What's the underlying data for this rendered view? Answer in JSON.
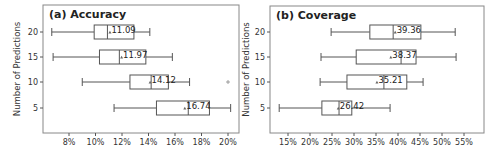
{
  "chart_data": [
    {
      "type": "box",
      "title": "(a) Accuracy",
      "xlabel": "",
      "ylabel": "Number of Predictions",
      "orientation": "horizontal",
      "xlim": [
        6.3,
        20.7
      ],
      "xticks": [
        8,
        10,
        12,
        14,
        16,
        18,
        20
      ],
      "xtick_labels": [
        "8%",
        "10%",
        "12%",
        "14%",
        "16%",
        "18%",
        "20%"
      ],
      "categories": [
        "20",
        "15",
        "10",
        "5"
      ],
      "series": [
        {
          "name": "20",
          "whisker_low": 6.7,
          "q1": 9.9,
          "median": 10.9,
          "q3": 12.9,
          "whisker_high": 14.1,
          "mean": 11.09,
          "outliers": []
        },
        {
          "name": "15",
          "whisker_low": 6.8,
          "q1": 10.3,
          "median": 11.8,
          "q3": 13.8,
          "whisker_high": 15.8,
          "mean": 11.97,
          "outliers": []
        },
        {
          "name": "10",
          "whisker_low": 9.0,
          "q1": 12.6,
          "median": 14.2,
          "q3": 15.5,
          "whisker_high": 17.1,
          "mean": 14.12,
          "outliers": [
            20.0
          ]
        },
        {
          "name": "5",
          "whisker_low": 11.4,
          "q1": 14.6,
          "median": 17.0,
          "q3": 18.6,
          "whisker_high": 20.2,
          "mean": 16.74,
          "outliers": []
        }
      ],
      "mean_labels": [
        "11.09",
        "11.97",
        "14.12",
        "16.74"
      ],
      "grid": false,
      "legend": null
    },
    {
      "type": "box",
      "title": "(b) Coverage",
      "xlabel": "",
      "ylabel": "Number of Predictions",
      "orientation": "horizontal",
      "xlim": [
        10.9,
        55.5
      ],
      "xticks": [
        15,
        20,
        25,
        30,
        35,
        40,
        45,
        50,
        55
      ],
      "xtick_labels": [
        "15%",
        "20%",
        "25%",
        "30%",
        "35%",
        "40%",
        "45%",
        "50%",
        "55%"
      ],
      "categories": [
        "20",
        "15",
        "10",
        "5"
      ],
      "series": [
        {
          "name": "20",
          "whisker_low": 24.8,
          "q1": 33.6,
          "median": 38.9,
          "q3": 45.2,
          "whisker_high": 53.0,
          "mean": 39.36,
          "outliers": []
        },
        {
          "name": "15",
          "whisker_low": 22.5,
          "q1": 30.5,
          "median": 40.7,
          "q3": 44.1,
          "whisker_high": 53.2,
          "mean": 38.37,
          "outliers": []
        },
        {
          "name": "10",
          "whisker_low": 22.3,
          "q1": 28.4,
          "median": 36.8,
          "q3": 42.0,
          "whisker_high": 45.7,
          "mean": 35.21,
          "outliers": []
        },
        {
          "name": "5",
          "whisker_low": 13.0,
          "q1": 22.7,
          "median": 26.6,
          "q3": 29.5,
          "whisker_high": 38.2,
          "mean": 26.42,
          "outliers": []
        }
      ],
      "mean_labels": [
        "39.36",
        "38.37",
        "35.21",
        "26.42"
      ],
      "grid": false,
      "legend": null
    }
  ],
  "panels": [
    {
      "title": "(a) Accuracy",
      "ylabel": "Number of Predictions"
    },
    {
      "title": "(b) Coverage",
      "ylabel": "Number of Predictions"
    }
  ]
}
